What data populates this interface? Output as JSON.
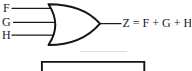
{
  "diagram": {
    "kind": "logic-circuit",
    "gate": {
      "type": "OR",
      "inputs": [
        {
          "label": "F"
        },
        {
          "label": "G"
        },
        {
          "label": "H"
        }
      ],
      "output_equation": "Z = F + G + H"
    },
    "colors": {
      "stroke": "#1a1a1a",
      "background": "#ffffff"
    }
  }
}
